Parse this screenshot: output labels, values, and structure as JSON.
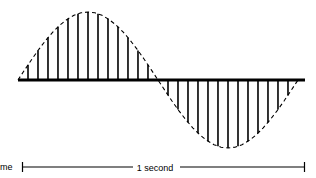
{
  "figure": {
    "title": "",
    "axis_label": "me",
    "scale_label": "1 second"
  },
  "chart_data": {
    "type": "line",
    "title": "",
    "subtitle": "",
    "xlabel": "me",
    "ylabel": "",
    "annotations": [
      "1 second"
    ],
    "legend": [],
    "grid": false,
    "xlim": [
      0,
      1
    ],
    "ylim": [
      -1,
      1
    ],
    "waveform": {
      "shape": "sine",
      "cycles": 1,
      "period_seconds": 1,
      "amplitude": 1,
      "envelope_style": "dashed",
      "bars_style": "solid-vertical",
      "bars_per_half_cycle": 13
    },
    "x": [
      0.0,
      0.025,
      0.05,
      0.075,
      0.1,
      0.125,
      0.15,
      0.175,
      0.2,
      0.225,
      0.25,
      0.275,
      0.3,
      0.325,
      0.35,
      0.375,
      0.4,
      0.425,
      0.45,
      0.475,
      0.5,
      0.525,
      0.55,
      0.575,
      0.6,
      0.625,
      0.65,
      0.675,
      0.7,
      0.725,
      0.75,
      0.775,
      0.8,
      0.825,
      0.85,
      0.875,
      0.9,
      0.925,
      0.95,
      0.975,
      1.0
    ],
    "y": [
      0.0,
      0.156,
      0.309,
      0.454,
      0.588,
      0.707,
      0.809,
      0.891,
      0.951,
      0.988,
      1.0,
      0.988,
      0.951,
      0.891,
      0.809,
      0.707,
      0.588,
      0.454,
      0.309,
      0.156,
      0.0,
      -0.156,
      -0.309,
      -0.454,
      -0.588,
      -0.707,
      -0.809,
      -0.891,
      -0.951,
      -0.988,
      -1.0,
      -0.988,
      -0.951,
      -0.891,
      -0.809,
      -0.707,
      -0.588,
      -0.454,
      -0.309,
      -0.156,
      0.0
    ],
    "bar_samples_positive_x": [
      0.0357,
      0.0714,
      0.1071,
      0.1428,
      0.1785,
      0.2142,
      0.25,
      0.2857,
      0.3214,
      0.3571,
      0.3928,
      0.4285,
      0.4642
    ],
    "bar_samples_positive_y": [
      0.2225,
      0.4339,
      0.6235,
      0.7818,
      0.901,
      0.9759,
      1.0,
      0.9759,
      0.901,
      0.7818,
      0.6235,
      0.4339,
      0.2225
    ],
    "bar_samples_negative_x": [
      0.5357,
      0.5714,
      0.6071,
      0.6428,
      0.6785,
      0.7142,
      0.75,
      0.7857,
      0.8214,
      0.8571,
      0.8928,
      0.9285,
      0.9642
    ],
    "bar_samples_negative_y": [
      -0.2225,
      -0.4339,
      -0.6235,
      -0.7818,
      -0.901,
      -0.9759,
      -1.0,
      -0.9759,
      -0.901,
      -0.7818,
      -0.6235,
      -0.4339,
      -0.2225
    ]
  },
  "geometry": {
    "baseline_y": 80,
    "axis_x_start": 18,
    "axis_x_end": 305,
    "wave_x_start": 18,
    "wave_x_zero_cross": 158,
    "wave_x_end": 298,
    "amplitude_px": 68,
    "scale_bar_y": 167,
    "scale_bar_x_start": 22,
    "scale_bar_x_end": 305,
    "scale_label_center_x": 155
  },
  "colors": {
    "ink": "#000000",
    "background": "#ffffff"
  }
}
